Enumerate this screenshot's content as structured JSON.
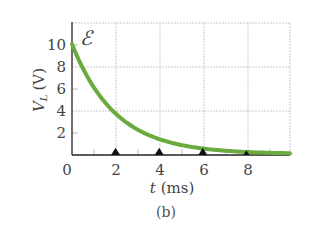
{
  "chart_data": {
    "type": "line",
    "title": "",
    "xlabel": "t (ms)",
    "ylabel": "V_L (V)",
    "xlim": [
      0,
      10
    ],
    "ylim": [
      0,
      12
    ],
    "x_ticks": [
      0,
      2,
      4,
      6,
      8
    ],
    "y_ticks": [
      2,
      4,
      6,
      8,
      10
    ],
    "x_tick_labels": [
      "0",
      "2",
      "4",
      "6",
      "8"
    ],
    "y_tick_labels": [
      "2",
      "4",
      "6",
      "8",
      "10"
    ],
    "grid": true,
    "annotation": "ℰ",
    "caption": "(b)",
    "series": [
      {
        "name": "V_L",
        "color": "#6aaa3f",
        "function": "10*exp(-t/2)",
        "x": [
          0,
          1,
          2,
          3,
          4,
          5,
          6,
          7,
          8,
          9,
          10
        ],
        "y": [
          10.0,
          6.07,
          3.68,
          2.23,
          1.35,
          0.82,
          0.5,
          0.3,
          0.18,
          0.11,
          0.07
        ]
      }
    ],
    "markers": {
      "shape": "triangle",
      "color": "#111111",
      "x": [
        2,
        4,
        6,
        8
      ]
    }
  },
  "labels": {
    "x_axis": "t",
    "x_unit": "(ms)",
    "y_axis_main": "V",
    "y_axis_sub": "L",
    "y_unit": "(V)",
    "emf_symbol": "ℰ",
    "caption": "(b)",
    "x_ticks": [
      "0",
      "2",
      "4",
      "6",
      "8"
    ],
    "y_ticks": [
      "2",
      "4",
      "6",
      "8",
      "10"
    ]
  }
}
